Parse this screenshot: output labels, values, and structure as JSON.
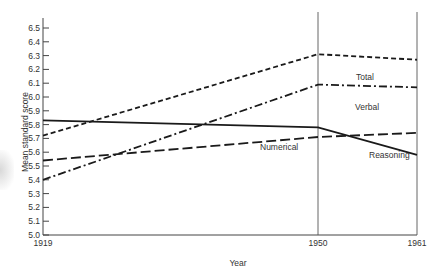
{
  "chart_data": {
    "type": "line",
    "title": "",
    "xlabel": "Year",
    "ylabel": "Mean standard score",
    "x": [
      1919,
      1950,
      1961
    ],
    "x_tick_labels": [
      "1919",
      "1950",
      "1961"
    ],
    "ylim": [
      5.0,
      6.5
    ],
    "y_ticks": [
      5.0,
      5.1,
      5.2,
      5.3,
      5.4,
      5.5,
      5.6,
      5.7,
      5.8,
      5.9,
      6.0,
      6.1,
      6.2,
      6.3,
      6.4,
      6.5
    ],
    "y_tick_labels": [
      "5.0",
      "5.1",
      "5.2",
      "5.3",
      "5.4",
      "5.5",
      "5.6",
      "5.7",
      "5.8",
      "5.9",
      "6.0",
      "6.1",
      "6.2",
      "6.3",
      "6.4",
      "6.5"
    ],
    "grid": false,
    "vertical_reference_lines": [
      1950,
      1961
    ],
    "series": [
      {
        "name": "Total",
        "style": "dashed",
        "values": [
          5.72,
          6.31,
          6.27
        ]
      },
      {
        "name": "Verbal",
        "style": "dash-dot",
        "values": [
          5.4,
          6.09,
          6.07
        ]
      },
      {
        "name": "Numerical",
        "style": "solid",
        "values": [
          5.83,
          5.78,
          5.58
        ]
      },
      {
        "name": "Reasoning",
        "style": "long-dash",
        "values": [
          5.54,
          5.71,
          5.74
        ]
      }
    ],
    "legend": "inline labels near lines"
  },
  "labels": {
    "xlabel": "Year",
    "ylabel": "Mean standard score",
    "total": "Total",
    "verbal": "Verbal",
    "numerical": "Numerical",
    "reasoning": "Reasoning"
  }
}
